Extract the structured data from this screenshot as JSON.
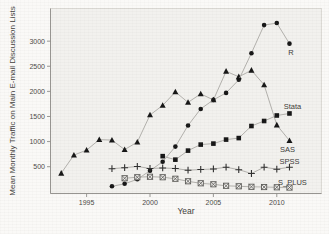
{
  "figure": {
    "page_bg": "#faf9f7",
    "plot_bg": "#f2f1ee",
    "frame_color": "#dcdad5",
    "axis_color": "#8f8d89",
    "tick_text_color": "#4b4a47",
    "line_color": "#b3b1ad"
  },
  "chart_data": {
    "type": "line",
    "title": "",
    "xlabel": "Year",
    "ylabel": "Mean Monthly Traffic on Main E-mail Discussion Lists",
    "xlim": [
      1992.2,
      2013.5
    ],
    "ylim": [
      0,
      3650
    ],
    "grid": false,
    "legend_position": "right-end-inline-labels",
    "xticks": [
      1995,
      2000,
      2005,
      2010
    ],
    "yticks": [
      500,
      1000,
      1500,
      2000,
      2500,
      3000
    ],
    "series": [
      {
        "name": "SAS",
        "label": "SAS",
        "marker": "filled-triangle",
        "color": "#161616",
        "label_dx": -2,
        "label_dy": 8.5,
        "x": [
          1993,
          1994,
          1995,
          1996,
          1997,
          1998,
          1999,
          2000,
          2001,
          2002,
          2003,
          2004,
          2005,
          2006,
          2007,
          2008,
          2009,
          2010,
          2011
        ],
        "values": [
          370,
          730,
          830,
          1040,
          1030,
          840,
          990,
          1530,
          1720,
          1990,
          1780,
          1950,
          1830,
          2400,
          2290,
          2420,
          2130,
          1330,
          1020
        ]
      },
      {
        "name": "R",
        "label": "R",
        "marker": "filled-circle",
        "color": "#161616",
        "label_dx": 1.5,
        "label_dy": 9,
        "x": [
          1997,
          1998,
          1999,
          2000,
          2001,
          2002,
          2003,
          2004,
          2005,
          2006,
          2007,
          2008,
          2009,
          2010,
          2011
        ],
        "values": [
          110,
          160,
          250,
          420,
          600,
          900,
          1320,
          1650,
          1830,
          1970,
          2230,
          2760,
          3320,
          3360,
          2950
        ]
      },
      {
        "name": "Stata",
        "label": "Stata",
        "marker": "filled-square",
        "color": "#161616",
        "label_dx": 3,
        "label_dy": -7,
        "x": [
          2001,
          2002,
          2003,
          2004,
          2005,
          2006,
          2007,
          2008,
          2009,
          2010,
          2011
        ],
        "values": [
          710,
          640,
          820,
          940,
          960,
          1040,
          1070,
          1310,
          1410,
          1520,
          1560
        ]
      },
      {
        "name": "SPSS",
        "label": "SPSS",
        "marker": "plus",
        "color": "#2f2f2f",
        "label_dx": 0,
        "label_dy": -5.5,
        "x": [
          1997,
          1998,
          1999,
          2000,
          2001,
          2002,
          2003,
          2004,
          2005,
          2006,
          2007,
          2008,
          2009,
          2010,
          2011
        ],
        "values": [
          460,
          480,
          505,
          465,
          475,
          465,
          430,
          445,
          455,
          490,
          440,
          365,
          490,
          450,
          490
        ]
      },
      {
        "name": "S_PLUS",
        "label": "S_PLUS",
        "marker": "boxed-x",
        "color": "#5c5b58",
        "label_dx": 3,
        "label_dy": -5.5,
        "x": [
          1998,
          1999,
          2000,
          2001,
          2002,
          2003,
          2004,
          2005,
          2006,
          2007,
          2008,
          2009,
          2010,
          2011
        ],
        "values": [
          270,
          290,
          300,
          290,
          260,
          210,
          170,
          150,
          120,
          110,
          100,
          95,
          90,
          85
        ]
      }
    ]
  }
}
